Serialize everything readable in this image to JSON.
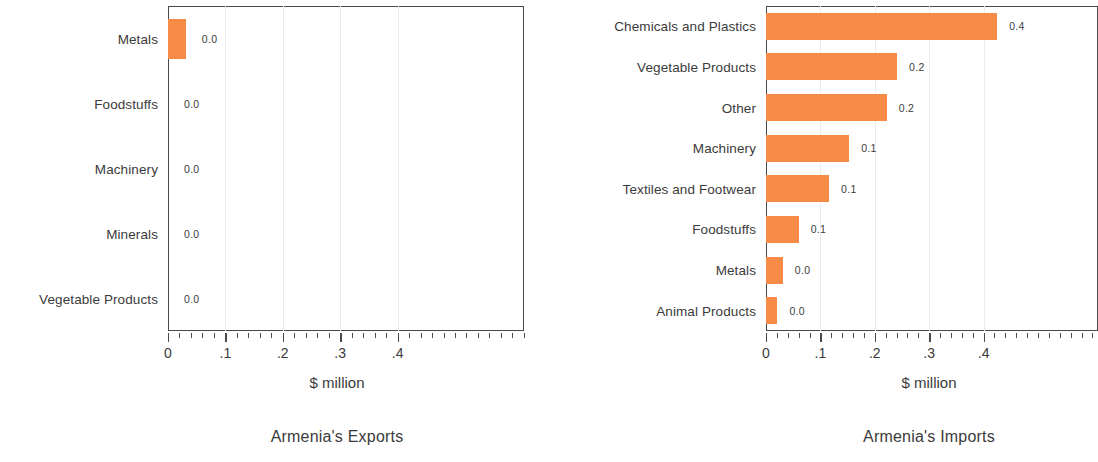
{
  "chart_data": [
    {
      "type": "bar",
      "orientation": "horizontal",
      "title": "Armenia's Exports",
      "xlabel": "$ million",
      "ylabel": "",
      "xlim": [
        0,
        0.5
      ],
      "grid": false,
      "tick_labels": [
        "0",
        ".1",
        ".2",
        ".3",
        ".4"
      ],
      "tick_values": [
        0,
        0.1,
        0.2,
        0.3,
        0.4
      ],
      "minor_tick_step": 0.02,
      "bar_color": "#f68b48",
      "categories": [
        "Metals",
        "Foodstuffs",
        "Machinery",
        "Minerals",
        "Vegetable Products"
      ],
      "values": [
        0.031,
        0.0,
        0.0,
        0.0,
        0.0
      ],
      "data_labels": [
        "0.0",
        "0.0",
        "0.0",
        "0.0",
        "0.0"
      ]
    },
    {
      "type": "bar",
      "orientation": "horizontal",
      "title": "Armenia's Imports",
      "xlabel": "$ million",
      "ylabel": "",
      "xlim": [
        0,
        0.5
      ],
      "grid": false,
      "tick_labels": [
        "0",
        ".1",
        ".2",
        ".3",
        ".4"
      ],
      "tick_values": [
        0,
        0.1,
        0.2,
        0.3,
        0.4
      ],
      "minor_tick_step": 0.02,
      "bar_color": "#f68b48",
      "categories": [
        "Chemicals and Plastics",
        "Vegetable Products",
        "Other",
        "Machinery",
        "Textiles and Footwear",
        "Foodstuffs",
        "Metals",
        "Animal Products"
      ],
      "values": [
        0.425,
        0.241,
        0.222,
        0.153,
        0.116,
        0.06,
        0.031,
        0.021
      ],
      "data_labels": [
        "0.4",
        "0.2",
        "0.2",
        "0.1",
        "0.1",
        "0.1",
        "0.0",
        "0.0"
      ]
    }
  ],
  "panels": [
    {
      "caption": "Armenia's Exports",
      "axis_title": "$ million"
    },
    {
      "caption": "Armenia's Imports",
      "axis_title": "$ million"
    }
  ]
}
